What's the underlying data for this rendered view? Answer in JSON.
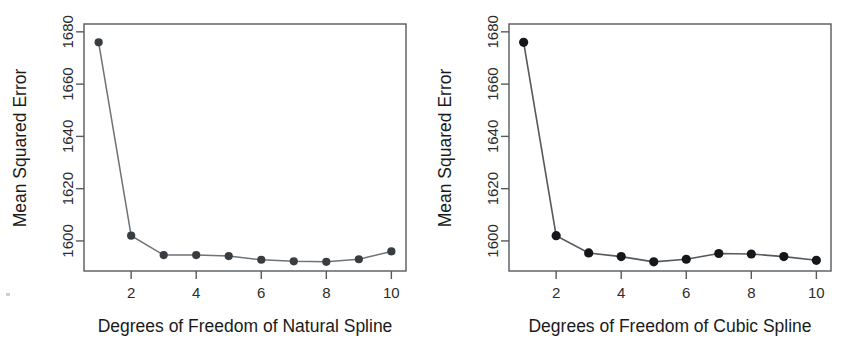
{
  "figure": {
    "panels": [
      {
        "name": "natural-spline",
        "xlabel": "Degrees of Freedom of Natural Spline",
        "ylabel": "Mean Squared Error",
        "xticks": [
          "2",
          "4",
          "6",
          "8",
          "10"
        ],
        "yticks": [
          "1600",
          "1620",
          "1640",
          "1660",
          "1680"
        ]
      },
      {
        "name": "cubic-spline",
        "xlabel": "Degrees of Freedom of Cubic Spline",
        "ylabel": "Mean Squared Error",
        "xticks": [
          "2",
          "4",
          "6",
          "8",
          "10"
        ],
        "yticks": [
          "1600",
          "1620",
          "1640",
          "1660",
          "1680"
        ]
      }
    ]
  },
  "chart_data": [
    {
      "type": "line",
      "title": "",
      "subtitle": "",
      "xlabel": "Degrees of Freedom of Natural Spline",
      "ylabel": "Mean Squared Error",
      "x": [
        1,
        2,
        3,
        4,
        5,
        6,
        7,
        8,
        9,
        10
      ],
      "xticks": [
        2,
        4,
        6,
        8,
        10
      ],
      "yticks": [
        1600,
        1620,
        1640,
        1660,
        1680
      ],
      "xlim": [
        0.55,
        10.45
      ],
      "ylim": [
        1588.5,
        1683
      ],
      "grid": false,
      "legend": false,
      "marker": "filled-circle",
      "line_color": "#6e7378",
      "marker_color": "#3a3d40",
      "series": [
        {
          "name": "Natural spline CV MSE",
          "values": [
            1676.0,
            1602.0,
            1594.6,
            1594.6,
            1594.2,
            1592.8,
            1592.2,
            1592.0,
            1593.0,
            1596.0
          ]
        }
      ]
    },
    {
      "type": "line",
      "title": "",
      "subtitle": "",
      "xlabel": "Degrees of Freedom of Cubic Spline",
      "ylabel": "Mean Squared Error",
      "x": [
        1,
        2,
        3,
        4,
        5,
        6,
        7,
        8,
        9,
        10
      ],
      "xticks": [
        2,
        4,
        6,
        8,
        10
      ],
      "yticks": [
        1600,
        1620,
        1640,
        1660,
        1680
      ],
      "xlim": [
        0.55,
        10.45
      ],
      "ylim": [
        1588.5,
        1683
      ],
      "grid": false,
      "legend": false,
      "marker": "filled-circle",
      "line_color": "#55595d",
      "marker_color": "#15171a",
      "series": [
        {
          "name": "Cubic spline CV MSE",
          "values": [
            1676.0,
            1602.0,
            1595.4,
            1594.0,
            1592.0,
            1593.0,
            1595.2,
            1595.0,
            1594.0,
            1592.6
          ]
        }
      ]
    }
  ]
}
